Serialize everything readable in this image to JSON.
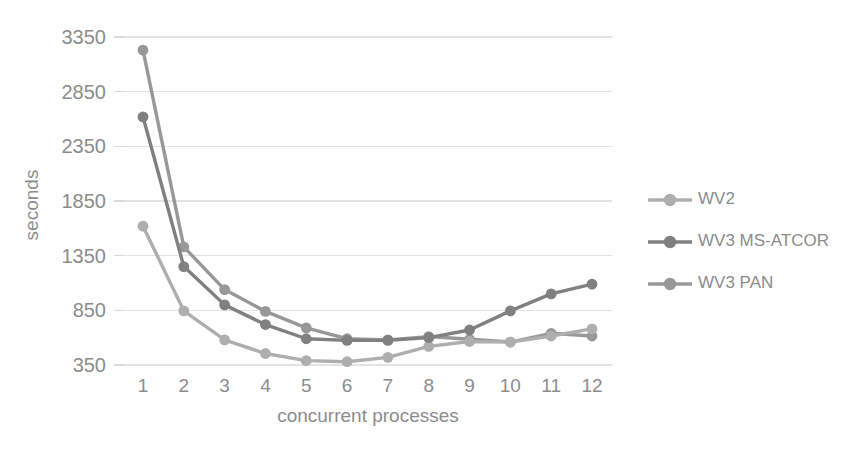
{
  "chart_data": {
    "type": "line",
    "title": "",
    "xlabel": "concurrent processes",
    "ylabel": "seconds",
    "x": [
      1,
      2,
      3,
      4,
      5,
      6,
      7,
      8,
      9,
      10,
      11,
      12
    ],
    "xtick_labels": [
      "1",
      "2",
      "3",
      "4",
      "5",
      "6",
      "7",
      "8",
      "9",
      "10",
      "11",
      "12"
    ],
    "ytick_labels": [
      "350",
      "850",
      "1350",
      "1850",
      "2350",
      "2850",
      "3350"
    ],
    "yticks": [
      350,
      850,
      1350,
      1850,
      2350,
      2850,
      3350
    ],
    "ylim": [
      350,
      3350
    ],
    "grid": true,
    "legend_position": "right",
    "series": [
      {
        "name": "WV2",
        "color": "#aeaeae",
        "values": [
          1620,
          845,
          580,
          455,
          390,
          380,
          420,
          520,
          565,
          560,
          615,
          680
        ]
      },
      {
        "name": "WV3 MS-ATCOR",
        "color": "#808080",
        "values": [
          2620,
          1250,
          900,
          720,
          590,
          575,
          575,
          600,
          670,
          845,
          1000,
          1090
        ]
      },
      {
        "name": "WV3 PAN",
        "color": "#989898",
        "values": [
          3230,
          1430,
          1040,
          840,
          690,
          590,
          580,
          610,
          585,
          560,
          640,
          615
        ]
      }
    ]
  },
  "legend": {
    "items": [
      {
        "label": "WV2",
        "color": "#aeaeae"
      },
      {
        "label": "WV3 MS-ATCOR",
        "color": "#808080"
      },
      {
        "label": "WV3 PAN",
        "color": "#989898"
      }
    ]
  },
  "axes": {
    "y_title": "seconds",
    "x_title": "concurrent processes"
  },
  "colors": {
    "gridline": "#e3e3e3",
    "text": "#8c8c8c",
    "background": "#ffffff"
  }
}
